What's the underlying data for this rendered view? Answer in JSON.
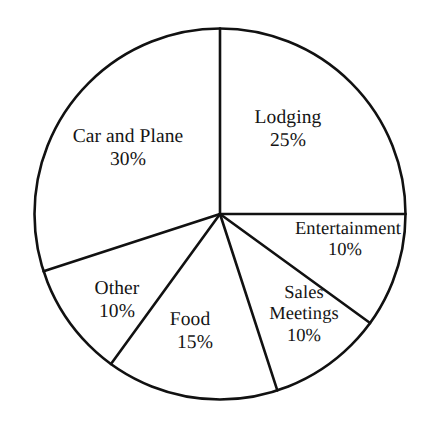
{
  "chart_data": {
    "type": "pie",
    "title": "",
    "subtitle": "",
    "xlabel": "",
    "ylabel": "",
    "legend": "none",
    "grid": false,
    "units": "percent",
    "total": 100,
    "start_angle_deg": 0,
    "direction": "clockwise",
    "categories": [
      "Lodging",
      "Entertainment",
      "Sales Meetings",
      "Food",
      "Other",
      "Car and Plane"
    ],
    "values": [
      25,
      10,
      10,
      15,
      10,
      30
    ],
    "value_labels": [
      "25%",
      "10%",
      "10%",
      "15%",
      "10%",
      "30%"
    ],
    "slices": [
      {
        "name": "Lodging",
        "value": 25,
        "value_label": "25%",
        "start_deg": 0,
        "end_deg": 90,
        "fill": "#ffffff",
        "stroke": "#111111"
      },
      {
        "name": "Entertainment",
        "value": 10,
        "value_label": "10%",
        "start_deg": 90,
        "end_deg": 126,
        "fill": "#ffffff",
        "stroke": "#111111"
      },
      {
        "name": "Sales Meetings",
        "value": 10,
        "value_label": "10%",
        "start_deg": 126,
        "end_deg": 162,
        "fill": "#ffffff",
        "stroke": "#111111"
      },
      {
        "name": "Food",
        "value": 15,
        "value_label": "15%",
        "start_deg": 162,
        "end_deg": 216,
        "fill": "#ffffff",
        "stroke": "#111111"
      },
      {
        "name": "Other",
        "value": 10,
        "value_label": "10%",
        "start_deg": 216,
        "end_deg": 252,
        "fill": "#ffffff",
        "stroke": "#111111"
      },
      {
        "name": "Car and Plane",
        "value": 30,
        "value_label": "30%",
        "start_deg": 252,
        "end_deg": 360,
        "fill": "#ffffff",
        "stroke": "#111111"
      }
    ],
    "sales_meetings_label_lines": [
      "Sales",
      "Meetings"
    ],
    "colors": {
      "slice_fill": "#ffffff",
      "outline": "#111111",
      "text": "#141414",
      "background": "#ffffff"
    }
  }
}
